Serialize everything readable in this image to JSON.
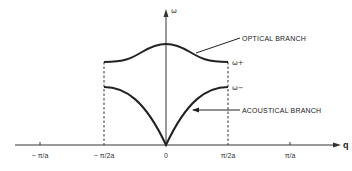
{
  "diagram": {
    "title": "",
    "axes": {
      "y_label": "ω",
      "x_label": "q",
      "x_ticks": [
        {
          "label": "− π/a",
          "x": 40
        },
        {
          "label": "− π/2a",
          "x": 104
        },
        {
          "label": "0",
          "x": 166
        },
        {
          "label": "π/2a",
          "x": 228
        },
        {
          "label": "π/a",
          "x": 290
        }
      ]
    },
    "branches": {
      "optical": {
        "label": "OPTICAL BRANCH",
        "edge_label": "ω+"
      },
      "acoustical": {
        "label": "ACOUSTICAL BRANCH",
        "edge_label": "ω−"
      }
    },
    "colors": {
      "line": "#222222",
      "background": "#ffffff"
    }
  }
}
